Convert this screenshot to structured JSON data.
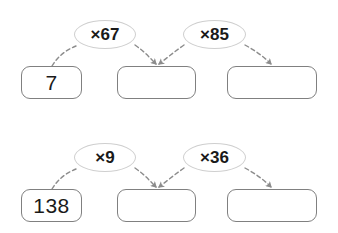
{
  "canvas": {
    "width": 338,
    "height": 233,
    "background": "#ffffff",
    "box_border_color": "#808080",
    "ellipse_border_color": "#cfcfcf",
    "arrow_color": "#8c8c8c",
    "text_color": "#1a1a1a"
  },
  "chains": [
    {
      "id": "chain-0",
      "boxes": [
        {
          "value": "7",
          "filled": true,
          "x": 21,
          "y": 52,
          "w": 61,
          "h": 33
        },
        {
          "value": "",
          "filled": false,
          "x": 117,
          "y": 52,
          "w": 79,
          "h": 33
        },
        {
          "value": "",
          "filled": false,
          "x": 227,
          "y": 52,
          "w": 90,
          "h": 33
        }
      ],
      "operations": [
        {
          "label": "×67",
          "x": 74,
          "y": 6,
          "w": 62,
          "h": 29
        },
        {
          "label": "×85",
          "x": 183,
          "y": 6,
          "w": 63,
          "h": 29
        }
      ],
      "arrows": [
        {
          "from": "box-0",
          "to": "op-0",
          "arrowhead": false,
          "path": "M 52 52 C 58 42 66 36 76 32"
        },
        {
          "from": "op-0",
          "to": "box-1",
          "arrowhead": true,
          "path": "M 135 31 C 145 38 150 44 156 50"
        },
        {
          "from": "op-1",
          "to": "box-1",
          "arrowhead": true,
          "path": "M 184 31 C 174 38 167 44 159 50"
        },
        {
          "from": "op-1",
          "to": "box-2",
          "arrowhead": true,
          "path": "M 245 31 C 256 37 264 43 271 50"
        }
      ]
    },
    {
      "id": "chain-1",
      "boxes": [
        {
          "value": "138",
          "filled": true,
          "x": 21,
          "y": 52,
          "w": 61,
          "h": 33
        },
        {
          "value": "",
          "filled": false,
          "x": 117,
          "y": 52,
          "w": 79,
          "h": 33
        },
        {
          "value": "",
          "filled": false,
          "x": 227,
          "y": 52,
          "w": 90,
          "h": 33
        }
      ],
      "operations": [
        {
          "label": "×9",
          "x": 74,
          "y": 6,
          "w": 62,
          "h": 29
        },
        {
          "label": "×36",
          "x": 183,
          "y": 6,
          "w": 63,
          "h": 29
        }
      ],
      "arrows": [
        {
          "from": "box-0",
          "to": "op-0",
          "arrowhead": false,
          "path": "M 52 52 C 58 42 66 36 76 32"
        },
        {
          "from": "op-0",
          "to": "box-1",
          "arrowhead": true,
          "path": "M 135 31 C 145 38 150 44 156 50"
        },
        {
          "from": "op-1",
          "to": "box-1",
          "arrowhead": true,
          "path": "M 184 31 C 174 38 167 44 159 50"
        },
        {
          "from": "op-1",
          "to": "box-2",
          "arrowhead": true,
          "path": "M 245 31 C 256 37 264 43 271 50"
        }
      ]
    }
  ]
}
